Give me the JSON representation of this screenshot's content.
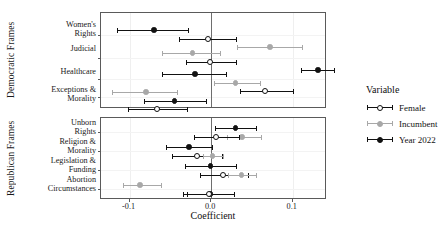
{
  "chart_data": {
    "type": "scatter",
    "subtype": "coefficient-plot-with-error-bars",
    "title": "",
    "xlabel": "Coefficient",
    "ylabel": "",
    "xlim": [
      -0.135,
      0.142
    ],
    "xticks": [
      -0.1,
      0.0,
      0.1
    ],
    "xticklabels": [
      "-0.1",
      "0.0",
      "0.1"
    ],
    "grid": true,
    "zero_reference_line": 0.0,
    "legend": {
      "title": "Variable",
      "position": "right",
      "entries": [
        {
          "name": "Female",
          "marker": "open-circle",
          "color": "#111111",
          "fill": "#ffffff"
        },
        {
          "name": "Incumbent",
          "marker": "filled-circle",
          "color": "#a8a8a8",
          "fill": "#a8a8a8"
        },
        {
          "name": "Year 2022",
          "marker": "filled-circle",
          "color": "#111111",
          "fill": "#111111"
        }
      ]
    },
    "facets": [
      {
        "strip_label": "Democratic Frames",
        "rows": [
          {
            "label": "Women's\nRights",
            "points": [
              {
                "series": "Year 2022",
                "estimate": -0.07,
                "ci_low": -0.115,
                "ci_high": -0.028
              },
              {
                "series": "Female",
                "estimate": -0.004,
                "ci_low": -0.039,
                "ci_high": 0.031
              },
              {
                "series": "Incumbent",
                "estimate": 0.072,
                "ci_low": 0.032,
                "ci_high": 0.111
              }
            ]
          },
          {
            "label": "Judicial",
            "points": [
              {
                "series": "Incumbent",
                "estimate": -0.023,
                "ci_low": -0.06,
                "ci_high": 0.011
              },
              {
                "series": "Female",
                "estimate": -0.001,
                "ci_low": -0.031,
                "ci_high": 0.03
              },
              {
                "series": "Year 2022",
                "estimate": 0.131,
                "ci_low": 0.11,
                "ci_high": 0.15
              }
            ]
          },
          {
            "label": "Healthcare",
            "points": [
              {
                "series": "Year 2022",
                "estimate": -0.02,
                "ci_low": -0.06,
                "ci_high": 0.018
              },
              {
                "series": "Incumbent",
                "estimate": 0.03,
                "ci_low": 0.003,
                "ci_high": 0.06
              },
              {
                "series": "Female",
                "estimate": 0.066,
                "ci_low": 0.035,
                "ci_high": 0.1
              }
            ]
          },
          {
            "label": "Exceptions &\nMorality",
            "points": [
              {
                "series": "Incumbent",
                "estimate": -0.08,
                "ci_low": -0.122,
                "ci_high": -0.042
              },
              {
                "series": "Year 2022",
                "estimate": -0.045,
                "ci_low": -0.082,
                "ci_high": -0.006
              },
              {
                "series": "Female",
                "estimate": -0.066,
                "ci_low": -0.102,
                "ci_high": -0.029
              }
            ]
          }
        ]
      },
      {
        "strip_label": "Republican Frames",
        "rows": [
          {
            "label": "Unborn\nRights",
            "points": [
              {
                "series": "Year 2022",
                "estimate": 0.03,
                "ci_low": 0.005,
                "ci_high": 0.055
              },
              {
                "series": "Incumbent",
                "estimate": 0.038,
                "ci_low": 0.019,
                "ci_high": 0.061
              },
              {
                "series": "Female",
                "estimate": 0.006,
                "ci_low": -0.021,
                "ci_high": 0.034
              }
            ]
          },
          {
            "label": "Religion &\nMorality",
            "points": [
              {
                "series": "Year 2022",
                "estimate": -0.027,
                "ci_low": -0.055,
                "ci_high": 0.001
              },
              {
                "series": "Female",
                "estimate": -0.017,
                "ci_low": -0.048,
                "ci_high": 0.013
              },
              {
                "series": "Incumbent",
                "estimate": 0.002,
                "ci_low": -0.01,
                "ci_high": 0.014
              }
            ]
          },
          {
            "label": "Legislation &\nFunding",
            "points": [
              {
                "series": "Year 2022",
                "estimate": -0.001,
                "ci_low": -0.032,
                "ci_high": 0.03
              },
              {
                "series": "Female",
                "estimate": 0.015,
                "ci_low": -0.014,
                "ci_high": 0.045
              },
              {
                "series": "Incumbent",
                "estimate": 0.037,
                "ci_low": 0.021,
                "ci_high": 0.055
              }
            ]
          },
          {
            "label": "Abortion\nCircumstances",
            "points": [
              {
                "series": "Incumbent",
                "estimate": -0.087,
                "ci_low": -0.108,
                "ci_high": -0.062
              },
              {
                "series": "Year 2022",
                "estimate": -0.001,
                "ci_low": -0.03,
                "ci_high": 0.028
              },
              {
                "series": "Female",
                "estimate": -0.003,
                "ci_low": -0.034,
                "ci_high": 0.028
              }
            ]
          }
        ]
      }
    ]
  },
  "colors": {
    "female": "#111111",
    "incumbent": "#a8a8a8",
    "year2022": "#111111",
    "panel_border": "#5a5a5a",
    "grid": "#efefef",
    "zero_line": "#6e6e6e"
  }
}
